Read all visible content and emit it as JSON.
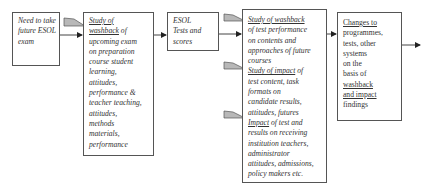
{
  "diagram": {
    "type": "flowchart",
    "direction": "left-to-right",
    "nodes": [
      {
        "id": "need",
        "lines": [
          "Need to take",
          "future ESOL",
          "exam"
        ],
        "style": "italic"
      },
      {
        "id": "washback_prep",
        "lines_underlined": [
          "Study of",
          "washback"
        ],
        "lines": [
          " of",
          "upcoming exam",
          "on preparation",
          "course student",
          "learning,",
          "attitudes,",
          "performance &",
          "teacher teaching,",
          "attitudes,",
          "methods",
          "materials,",
          "performance"
        ],
        "style": "italic"
      },
      {
        "id": "esol",
        "lines": [
          "ESOL",
          "Tests and",
          "scores"
        ],
        "style": "italic"
      },
      {
        "id": "studies",
        "sections": [
          {
            "heading": "Study of washback",
            "lines": [
              "of test performance",
              "on contents and",
              "approaches of future",
              "courses"
            ]
          },
          {
            "heading": "Study of impact",
            "heading_suffix": " of",
            "lines": [
              "test content, task",
              "formats on",
              "candidate results,",
              "attitudes, futures"
            ]
          },
          {
            "heading": "Impact",
            "heading_suffix": " of test and",
            "lines": [
              "results on receiving",
              "institution teachers,",
              "administrator",
              "attitudes, admissions,",
              "policy makers etc."
            ]
          }
        ],
        "style": "italic"
      },
      {
        "id": "changes",
        "heading": "Changes to",
        "lines": [
          "programmes,",
          "tests, other",
          "systems",
          "on the",
          "basis of"
        ],
        "underlined_tail": [
          "washback",
          "and impact"
        ],
        "tail": "findings",
        "style": "roman"
      }
    ],
    "edges": [
      {
        "from": "need",
        "to": "washback_prep",
        "type": "arrow"
      },
      {
        "from": "washback_prep",
        "to": "esol",
        "type": "arrow"
      },
      {
        "from": "esol",
        "to": "studies",
        "type": "arrow"
      },
      {
        "from": "studies",
        "to": "changes",
        "type": "arrow"
      },
      {
        "from": "changes",
        "to": "out",
        "type": "arrow"
      }
    ],
    "callout_flags": 4,
    "colors": {
      "border": "#555555",
      "flag_fill": "#b8b8b8",
      "text": "#333333"
    }
  }
}
